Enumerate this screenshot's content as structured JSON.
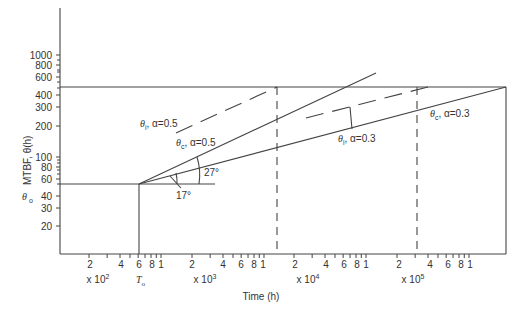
{
  "chart_data": {
    "type": "line",
    "title": "",
    "xlabel": "Time (h)",
    "ylabel": "MTBF, θ(h)",
    "x_scale": "log",
    "y_scale": "log",
    "xlim": [
      100,
      2500000
    ],
    "ylim": [
      10,
      2000
    ],
    "grid": false,
    "y_ticks": [
      {
        "value": 1000,
        "label": "1000",
        "y": 55
      },
      {
        "value": 800,
        "label": "800",
        "y": 65
      },
      {
        "value": 600,
        "label": "600",
        "y": 77
      },
      {
        "value": 400,
        "label": "400",
        "y": 95
      },
      {
        "value": 300,
        "label": "300",
        "y": 107
      },
      {
        "value": 200,
        "label": "200",
        "y": 126
      },
      {
        "value": 100,
        "label": "100",
        "y": 157
      },
      {
        "value": 80,
        "label": "80",
        "y": 167
      },
      {
        "value": 60,
        "label": "60",
        "y": 179
      },
      {
        "value": 40,
        "label": "40",
        "y": 196
      },
      {
        "value": 30,
        "label": "30",
        "y": 208
      },
      {
        "value": 20,
        "label": "20",
        "y": 226
      }
    ],
    "y_minor_ticks_y": [
      60,
      70,
      72,
      82,
      88,
      160,
      163,
      170,
      174,
      184
    ],
    "x_tick_labels": [
      {
        "label": "2",
        "x": 90
      },
      {
        "label": "4",
        "x": 121
      },
      {
        "label": "6",
        "x": 139
      },
      {
        "label": "8",
        "x": 152
      },
      {
        "label": "1",
        "x": 161
      },
      {
        "label": "2",
        "x": 192
      },
      {
        "label": "4",
        "x": 223
      },
      {
        "label": "6",
        "x": 241
      },
      {
        "label": "8",
        "x": 254
      },
      {
        "label": "1",
        "x": 263
      },
      {
        "label": "2",
        "x": 295
      },
      {
        "label": "4",
        "x": 326
      },
      {
        "label": "6",
        "x": 344
      },
      {
        "label": "8",
        "x": 357
      },
      {
        "label": "1",
        "x": 366
      },
      {
        "label": "2",
        "x": 399
      },
      {
        "label": "4",
        "x": 430
      },
      {
        "label": "6",
        "x": 448
      },
      {
        "label": "8",
        "x": 461
      },
      {
        "label": "1",
        "x": 470
      }
    ],
    "x_multipliers": [
      {
        "label": "x 10",
        "exp": "2",
        "x": 98
      },
      {
        "label": "x 10",
        "exp": "3",
        "x": 205
      },
      {
        "label": "x 10",
        "exp": "4",
        "x": 308
      },
      {
        "label": "x 10",
        "exp": "5",
        "x": 413
      }
    ],
    "special_labels": {
      "T0": "T",
      "T0_sub": "o",
      "theta0": "θ",
      "theta0_sub": "o"
    },
    "reference_lines": [
      {
        "name": "target-mtbf-line",
        "type": "horizontal",
        "theta": 500,
        "x_from": 100,
        "x_to": 2500000,
        "style": "solid"
      },
      {
        "name": "initial-mtbf-line",
        "type": "horizontal",
        "theta": 50,
        "x_from": 100,
        "x_to": 3500,
        "style": "solid"
      },
      {
        "name": "T0-line",
        "type": "vertical",
        "t": 600,
        "theta_from": 10,
        "theta_to": 50,
        "style": "solid"
      },
      {
        "name": "alpha05-time-line",
        "type": "vertical",
        "t": 14000,
        "theta_from": 10,
        "theta_to": 500,
        "style": "dashed"
      },
      {
        "name": "alpha03-time-line",
        "type": "vertical",
        "t": 280000,
        "theta_from": 10,
        "theta_to": 500,
        "style": "dashed"
      },
      {
        "name": "right-bound-line",
        "type": "vertical",
        "t": 2500000,
        "theta_from": 10,
        "theta_to": 500,
        "style": "solid"
      }
    ],
    "series": [
      {
        "name": "θc, α=0.5",
        "style": "solid",
        "points": [
          [
            600,
            50
          ],
          [
            14000,
            240
          ],
          [
            60000,
            640
          ]
        ]
      },
      {
        "name": "θi, α=0.5",
        "style": "dashed",
        "points": [
          [
            1400,
            140
          ],
          [
            14000,
            500
          ]
        ]
      },
      {
        "name": "θc, α=0.3",
        "style": "solid",
        "points": [
          [
            600,
            50
          ],
          [
            14000,
            125
          ],
          [
            2500000,
            500
          ]
        ]
      },
      {
        "name": "θi, α=0.3",
        "style": "dashed",
        "points": [
          [
            28000,
            280
          ],
          [
            330000,
            500
          ]
        ]
      }
    ],
    "annotations": [
      {
        "text": "θ",
        "sub": "i",
        "rest": ", α=0.5",
        "x": 140,
        "y": 127
      },
      {
        "text": "θ",
        "sub": "c",
        "rest": ", α=0.5",
        "x": 176,
        "y": 146
      },
      {
        "text": "θ",
        "sub": "i",
        "rest": ", α=0.3",
        "x": 338,
        "y": 142
      },
      {
        "text": "θ",
        "sub": "c",
        "rest": ", α=0.3",
        "x": 430,
        "y": 117
      },
      {
        "text": "27°",
        "x": 204,
        "y": 176
      },
      {
        "text": "17°",
        "x": 176,
        "y": 199
      }
    ]
  }
}
